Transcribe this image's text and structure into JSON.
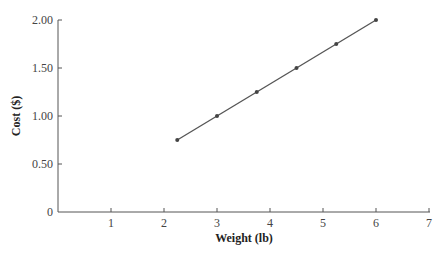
{
  "chart_data": {
    "type": "line",
    "title": "",
    "xlabel": "Weight (lb)",
    "ylabel": "Cost ($)",
    "xlim": [
      0,
      7
    ],
    "ylim": [
      0,
      2.0
    ],
    "x_ticks": [
      "1",
      "2",
      "3",
      "4",
      "5",
      "6",
      "7"
    ],
    "y_ticks": [
      "0",
      "0.50",
      "1.00",
      "1.50",
      "2.00"
    ],
    "grid": false,
    "series": [
      {
        "name": "Cost",
        "x": [
          2.25,
          3,
          3.75,
          4.5,
          5.25,
          6
        ],
        "y": [
          0.75,
          1.0,
          1.25,
          1.5,
          1.75,
          2.0
        ],
        "markers": true,
        "color": "#555555"
      }
    ]
  }
}
